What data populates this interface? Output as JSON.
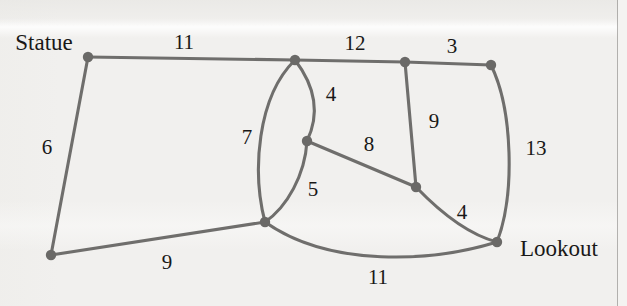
{
  "figure": {
    "type": "weighted-graph-diagram",
    "background_color": "#f1f0ee",
    "edge_color": "#6f6e6c",
    "node_color": "#6a6967",
    "label_color": "#191817"
  },
  "nodes": [
    {
      "id": "statue",
      "label": "Statue",
      "x": 88,
      "y": 57,
      "r": 5.2,
      "label_x": 44,
      "label_y": 42
    },
    {
      "id": "n_top_mid",
      "label": "",
      "x": 295,
      "y": 60,
      "r": 5.2,
      "label_x": 0,
      "label_y": 0
    },
    {
      "id": "n_top_r1",
      "label": "",
      "x": 405,
      "y": 62,
      "r": 5.2,
      "label_x": 0,
      "label_y": 0
    },
    {
      "id": "n_top_r2",
      "label": "",
      "x": 491,
      "y": 65,
      "r": 5.2,
      "label_x": 0,
      "label_y": 0
    },
    {
      "id": "n_center",
      "label": "",
      "x": 307,
      "y": 141,
      "r": 5.2,
      "label_x": 0,
      "label_y": 0
    },
    {
      "id": "n_mid_r",
      "label": "",
      "x": 416,
      "y": 187,
      "r": 5.2,
      "label_x": 0,
      "label_y": 0
    },
    {
      "id": "n_junct",
      "label": "",
      "x": 265,
      "y": 222,
      "r": 5.2,
      "label_x": 0,
      "label_y": 0
    },
    {
      "id": "lookout",
      "label": "Lookout",
      "x": 497,
      "y": 242,
      "r": 5.2,
      "label_x": 559,
      "label_y": 248
    },
    {
      "id": "n_bot_l",
      "label": "",
      "x": 51,
      "y": 255,
      "r": 5.2,
      "label_x": 0,
      "label_y": 0
    }
  ],
  "edges": [
    {
      "id": "e_statue_topmid",
      "from": "statue",
      "to": "n_top_mid",
      "weight": "11",
      "path": "M 88 57 L 295 60",
      "label_x": 184,
      "label_y": 42
    },
    {
      "id": "e_topmid_topr1",
      "from": "n_top_mid",
      "to": "n_top_r1",
      "weight": "12",
      "path": "M 295 60 L 405 62",
      "label_x": 355,
      "label_y": 43
    },
    {
      "id": "e_topr1_topr2",
      "from": "n_top_r1",
      "to": "n_top_r2",
      "weight": "3",
      "path": "M 405 62 L 491 65",
      "label_x": 452,
      "label_y": 46
    },
    {
      "id": "e_statue_botl",
      "from": "statue",
      "to": "n_bot_l",
      "weight": "6",
      "path": "M 88 57 L 51 255",
      "label_x": 47,
      "label_y": 147
    },
    {
      "id": "e_topmid_center",
      "from": "n_top_mid",
      "to": "n_center",
      "weight": "4",
      "path": "M 295 60 C 318 90 318 118 307 141",
      "label_x": 331,
      "label_y": 94
    },
    {
      "id": "e_topmid_junct",
      "from": "n_top_mid",
      "to": "n_junct",
      "weight": "7",
      "path": "M 295 60 C 257 97 252 172 265 222",
      "label_x": 247,
      "label_y": 137
    },
    {
      "id": "e_topr1_midr",
      "from": "n_top_r1",
      "to": "n_mid_r",
      "weight": "9",
      "path": "M 405 62 L 416 187",
      "label_x": 434,
      "label_y": 121
    },
    {
      "id": "e_center_midr",
      "from": "n_center",
      "to": "n_mid_r",
      "weight": "8",
      "path": "M 307 141 L 416 187",
      "label_x": 369,
      "label_y": 144
    },
    {
      "id": "e_topr2_lookout",
      "from": "n_top_r2",
      "to": "lookout",
      "weight": "13",
      "path": "M 491 65 C 513 110 515 195 497 242",
      "label_x": 536,
      "label_y": 148
    },
    {
      "id": "e_center_junct",
      "from": "n_center",
      "to": "n_junct",
      "weight": "5",
      "path": "M 307 141 C 305 175 287 207 265 222",
      "label_x": 313,
      "label_y": 189
    },
    {
      "id": "e_botl_junct",
      "from": "n_bot_l",
      "to": "n_junct",
      "weight": "9",
      "path": "M 51 255 L 265 222",
      "label_x": 167,
      "label_y": 262
    },
    {
      "id": "e_midr_lookout",
      "from": "n_mid_r",
      "to": "lookout",
      "weight": "4",
      "path": "M 416 187 C 441 213 470 235 497 242",
      "label_x": 462,
      "label_y": 212
    },
    {
      "id": "e_junct_lookout",
      "from": "n_junct",
      "to": "lookout",
      "weight": "11",
      "path": "M 265 222 C 330 268 432 262 497 242",
      "label_x": 378,
      "label_y": 277
    }
  ]
}
